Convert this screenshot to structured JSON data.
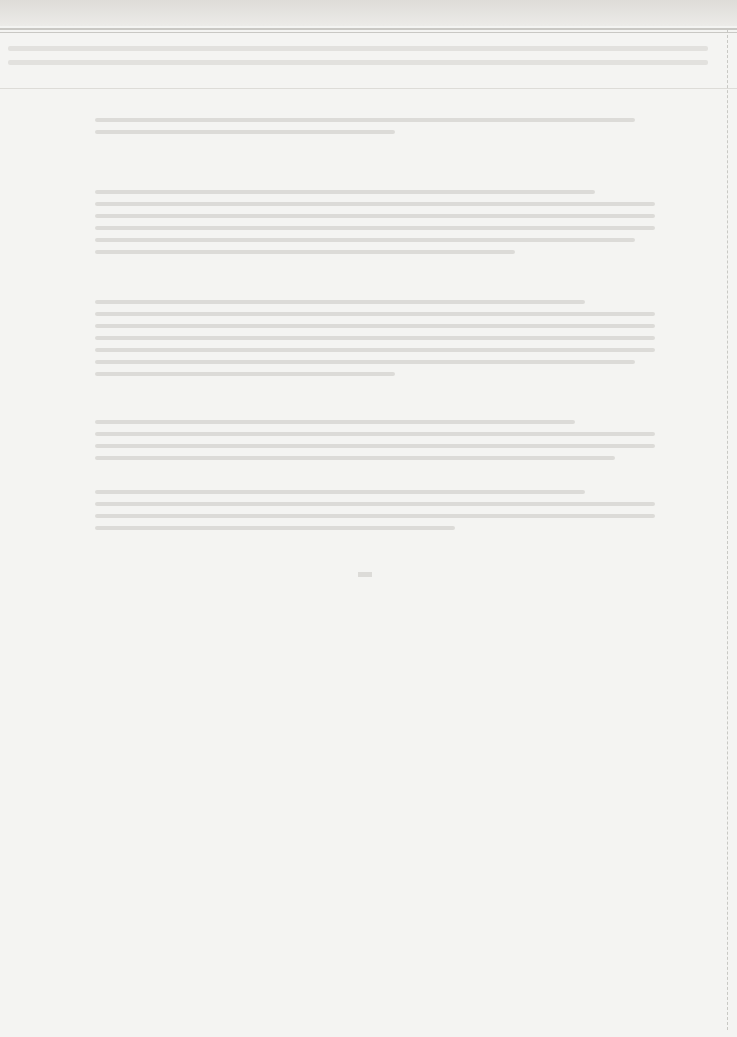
{
  "document": {
    "legibility": "text too faded to transcribe",
    "header_rows": 2,
    "paragraphs": [
      {
        "lines": 2,
        "widths": [
          540,
          300
        ]
      },
      {
        "lines": 6,
        "widths": [
          500,
          560,
          560,
          560,
          540,
          420
        ]
      },
      {
        "lines": 7,
        "widths": [
          490,
          560,
          560,
          560,
          560,
          540,
          300
        ]
      },
      {
        "lines": 4,
        "widths": [
          480,
          560,
          560,
          520
        ]
      },
      {
        "lines": 4,
        "widths": [
          490,
          560,
          560,
          360
        ]
      }
    ],
    "page_number_visible": true
  }
}
